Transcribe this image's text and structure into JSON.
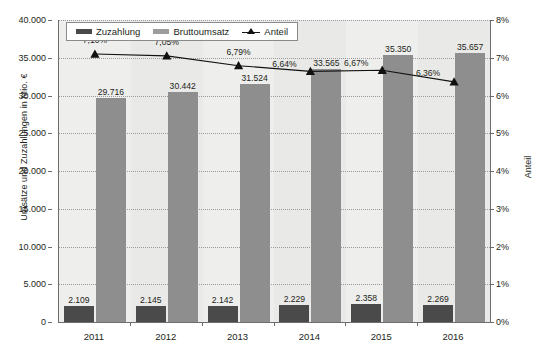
{
  "chart_data": {
    "type": "bar",
    "title": "",
    "categories": [
      "2011",
      "2012",
      "2013",
      "2014",
      "2015",
      "2016"
    ],
    "xlabel": "",
    "ylabel": "Umsätze und Zuzahlungen in Mio. €",
    "y2label": "Anteil",
    "ylim": [
      0,
      40000
    ],
    "y2lim": [
      0,
      8
    ],
    "grid": true,
    "legend_position": "top-left",
    "y_ticks": [
      "0",
      "5.000",
      "10.000",
      "15.000",
      "20.000",
      "25.000",
      "30.000",
      "35.000",
      "40.000"
    ],
    "y_tick_values": [
      0,
      5000,
      10000,
      15000,
      20000,
      25000,
      30000,
      35000,
      40000
    ],
    "y2_ticks": [
      "0%",
      "1%",
      "2%",
      "3%",
      "4%",
      "5%",
      "6%",
      "7%",
      "8%"
    ],
    "y2_tick_values": [
      0,
      1,
      2,
      3,
      4,
      5,
      6,
      7,
      8
    ],
    "series": [
      {
        "name": "Zuzahlung",
        "type": "bar",
        "axis": "left",
        "color": "#4a4a4a",
        "values": [
          2109,
          2145,
          2142,
          2229,
          2358,
          2269
        ],
        "labels": [
          "2.109",
          "2.145",
          "2.142",
          "2.229",
          "2.358",
          "2.269"
        ]
      },
      {
        "name": "Bruttoumsatz",
        "type": "bar",
        "axis": "left",
        "color": "#8e8e8e",
        "values": [
          29716,
          30442,
          31524,
          33565,
          35350,
          35657
        ],
        "labels": [
          "29.716",
          "30.442",
          "31.524",
          "33.565",
          "35.350",
          "35.657"
        ]
      },
      {
        "name": "Anteil",
        "type": "line",
        "axis": "right",
        "color": "#111111",
        "marker": "triangle",
        "values": [
          7.1,
          7.05,
          6.79,
          6.64,
          6.67,
          6.36
        ],
        "labels": [
          "7,10%",
          "7,05%",
          "6,79%",
          "6,64%",
          "6,67%",
          "6,36%"
        ]
      }
    ]
  },
  "legend": {
    "items": [
      {
        "label": "Zuzahlung"
      },
      {
        "label": "Bruttoumsatz"
      },
      {
        "label": "Anteil"
      }
    ]
  },
  "colors": {
    "plot_background": "#e9e9e7",
    "band": "#eeeeec",
    "axis": "#6d6d6d",
    "grid": "#9a9a9a",
    "bar_copay": "#4a4a4a",
    "bar_gross": "#8e8e8e",
    "line": "#111111",
    "text": "#231f20"
  }
}
